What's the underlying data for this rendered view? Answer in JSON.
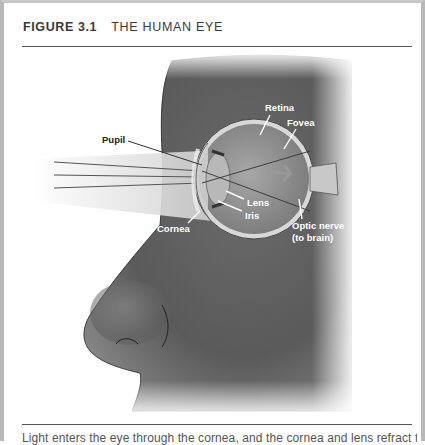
{
  "figure": {
    "number": "FIGURE 3.1",
    "title": "THE HUMAN EYE",
    "labels": {
      "pupil": "Pupil",
      "retina": "Retina",
      "fovea": "Fovea",
      "lens": "Lens",
      "iris": "Iris",
      "cornea": "Cornea",
      "optic_nerve_1": "Optic nerve",
      "optic_nerve_2": "(to brain)"
    },
    "caption": "Light enters the eye through the cornea, and the cornea and lens refract the"
  }
}
